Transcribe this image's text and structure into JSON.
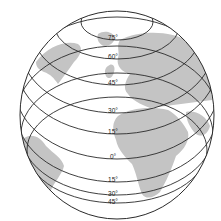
{
  "figure": {
    "type": "globe-latitude-diagram",
    "colors": {
      "background": "#ffffff",
      "ocean": "#ffffff",
      "land": "#c4c4c4",
      "lines": "#2a2a2a",
      "label": "#222222"
    },
    "latitude_labels": [
      {
        "id": "n75",
        "text": "75°",
        "x": 113,
        "y": 40
      },
      {
        "id": "n60",
        "text": "60°",
        "x": 113,
        "y": 59
      },
      {
        "id": "n45",
        "text": "45°",
        "x": 113,
        "y": 85
      },
      {
        "id": "n30",
        "text": "30°",
        "x": 113,
        "y": 113
      },
      {
        "id": "n15",
        "text": "15°",
        "x": 113,
        "y": 134
      },
      {
        "id": "eq",
        "text": "0°",
        "x": 113,
        "y": 159
      },
      {
        "id": "s15",
        "text": "15°",
        "x": 113,
        "y": 182
      },
      {
        "id": "s30",
        "text": "30°",
        "x": 113,
        "y": 196
      },
      {
        "id": "s45",
        "text": "45°",
        "x": 113,
        "y": 204
      }
    ],
    "landmasses": [
      "Greenland",
      "Europe",
      "Africa",
      "Arabia",
      "South America",
      "North America"
    ]
  }
}
